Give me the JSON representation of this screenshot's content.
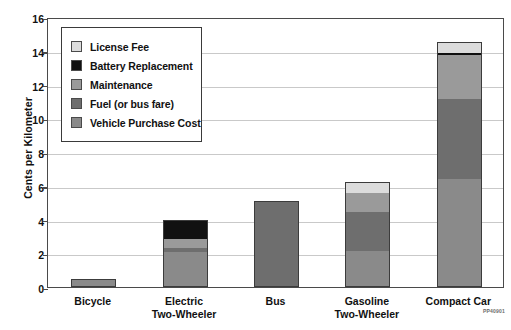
{
  "chart_data": {
    "type": "bar",
    "stacked": true,
    "title": "",
    "xlabel": "",
    "ylabel": "Cents per Kilometer",
    "ylim": [
      0,
      16
    ],
    "yticks": [
      0,
      2,
      4,
      6,
      8,
      10,
      12,
      14,
      16
    ],
    "ytick_labels": [
      "0",
      "2",
      "4",
      "6",
      "8",
      "10",
      "12",
      "14",
      "16"
    ],
    "grid": true,
    "grid_axis": "y",
    "legend_position": "upper-left-inside",
    "categories": [
      "Bicycle",
      "Electric Two-Wheeler",
      "Bus",
      "Gasoline Two-Wheeler",
      "Compact Car"
    ],
    "category_lines": [
      [
        "Bicycle"
      ],
      [
        "Electric",
        "Two-Wheeler"
      ],
      [
        "Bus"
      ],
      [
        "Gasoline",
        "Two-Wheeler"
      ],
      [
        "Compact Car"
      ]
    ],
    "series": [
      {
        "name": "Vehicle Purchase Cost",
        "color": "#8a8a8a",
        "values": [
          0.5,
          2.1,
          0.0,
          2.1,
          6.4
        ]
      },
      {
        "name": "Fuel (or bus fare)",
        "color": "#6e6e6e",
        "values": [
          0.0,
          0.2,
          5.1,
          2.4,
          4.8
        ]
      },
      {
        "name": "Maintenance",
        "color": "#9a9a9a",
        "values": [
          0.0,
          0.55,
          0.0,
          1.1,
          2.6
        ]
      },
      {
        "name": "Battery Replacement",
        "color": "#111111",
        "values": [
          0.0,
          1.15,
          0.0,
          0.0,
          0.15
        ]
      },
      {
        "name": "License Fee",
        "color": "#dcdcdc",
        "values": [
          0.0,
          0.0,
          0.0,
          0.6,
          0.55
        ]
      }
    ],
    "totals": [
      0.5,
      4.0,
      5.1,
      6.2,
      14.5
    ]
  },
  "legend": {
    "items": [
      {
        "label": "License Fee",
        "color": "#dcdcdc"
      },
      {
        "label": "Battery Replacement",
        "color": "#111111"
      },
      {
        "label": "Maintenance",
        "color": "#9a9a9a"
      },
      {
        "label": "Fuel (or bus fare)",
        "color": "#6e6e6e"
      },
      {
        "label": "Vehicle Purchase Cost",
        "color": "#8a8a8a"
      }
    ]
  },
  "footer": {
    "code": "PP40901"
  },
  "style": {
    "axis_color": "#4a4a4a",
    "grid_color": "#c9c9c9",
    "bar_border": "#3c3c3c",
    "text_color": "#111111"
  }
}
